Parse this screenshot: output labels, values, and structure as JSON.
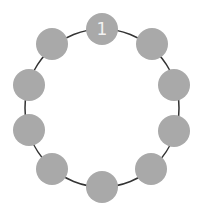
{
  "diagram": {
    "type": "circular-node-ring",
    "ring": {
      "cx": 102,
      "cy": 108,
      "rx": 77,
      "ry": 79,
      "stroke": "#333333",
      "stroke_width": 1.5
    },
    "node_style": {
      "radius": 16,
      "fill": "#a9a9a9",
      "label_color": "#f2f2f2"
    },
    "nodes": [
      {
        "id": "node-1",
        "cx": 102,
        "cy": 29,
        "label": "1"
      },
      {
        "id": "node-2",
        "cx": 152,
        "cy": 44,
        "label": ""
      },
      {
        "id": "node-3",
        "cx": 174,
        "cy": 85,
        "label": ""
      },
      {
        "id": "node-4",
        "cx": 174,
        "cy": 131,
        "label": ""
      },
      {
        "id": "node-5",
        "cx": 151,
        "cy": 169,
        "label": ""
      },
      {
        "id": "node-6",
        "cx": 102,
        "cy": 187,
        "label": ""
      },
      {
        "id": "node-7",
        "cx": 52,
        "cy": 169,
        "label": ""
      },
      {
        "id": "node-8",
        "cx": 29,
        "cy": 130,
        "label": ""
      },
      {
        "id": "node-9",
        "cx": 29,
        "cy": 85,
        "label": ""
      },
      {
        "id": "node-10",
        "cx": 52,
        "cy": 44,
        "label": ""
      }
    ]
  }
}
